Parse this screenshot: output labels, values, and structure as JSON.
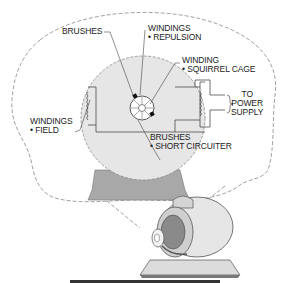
{
  "diagram": {
    "labels": {
      "brushes_top": "BRUSHES",
      "windings_repulsion": [
        "WINDINGS",
        "• REPULSION"
      ],
      "winding_squirrel_cage": [
        "WINDING",
        "• SQUIRREL CAGE"
      ],
      "power_supply": [
        "TO",
        "POWER",
        "SUPPLY"
      ],
      "windings_field": [
        "WINDINGS",
        "• FIELD"
      ],
      "brushes_short_circuiter": [
        "BRUSHES",
        "• SHORT CIRCUITER"
      ]
    },
    "colors": {
      "stator_fill": "#e6e6e6",
      "base_fill": "#a6a6a6",
      "line": "#333333",
      "dash": "#888888"
    }
  }
}
